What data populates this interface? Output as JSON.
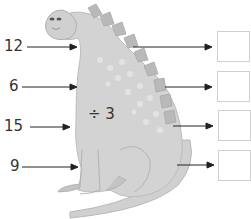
{
  "operation": {
    "label": "÷ 3",
    "operator": "÷",
    "operand": 3
  },
  "inputs": [
    {
      "value": "12"
    },
    {
      "value": "6"
    },
    {
      "value": "15"
    },
    {
      "value": "9"
    }
  ],
  "outputs": [
    {
      "value": ""
    },
    {
      "value": ""
    },
    {
      "value": ""
    },
    {
      "value": ""
    }
  ],
  "colors": {
    "body": "#d3d3d3",
    "body_dark": "#b5b5b5",
    "spots": "#e2e2e2",
    "arrow": "#222222",
    "box_border": "#cfcfcf"
  }
}
